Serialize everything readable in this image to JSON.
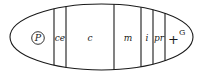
{
  "diagram": {
    "shape": "ellipse",
    "stroke_color": "#1a1a1a",
    "ellipse": {
      "cx": 101.5,
      "cy": 37,
      "rx": 91.5,
      "ry": 33
    },
    "dividers_x": [
      54,
      66,
      114,
      141,
      153,
      165
    ],
    "pole_marker": {
      "label": "P",
      "circled": true,
      "cx": 38,
      "cy": 38
    },
    "segments": [
      {
        "id": "ce",
        "label": "ce",
        "x": 60
      },
      {
        "id": "c",
        "label": "c",
        "x": 90
      },
      {
        "id": "m",
        "label": "m",
        "x": 128
      },
      {
        "id": "i",
        "label": "i",
        "x": 147
      },
      {
        "id": "pr",
        "label": "pr",
        "x": 159
      }
    ],
    "terminal_marker": {
      "symbol": "+",
      "superscript": "G"
    }
  }
}
